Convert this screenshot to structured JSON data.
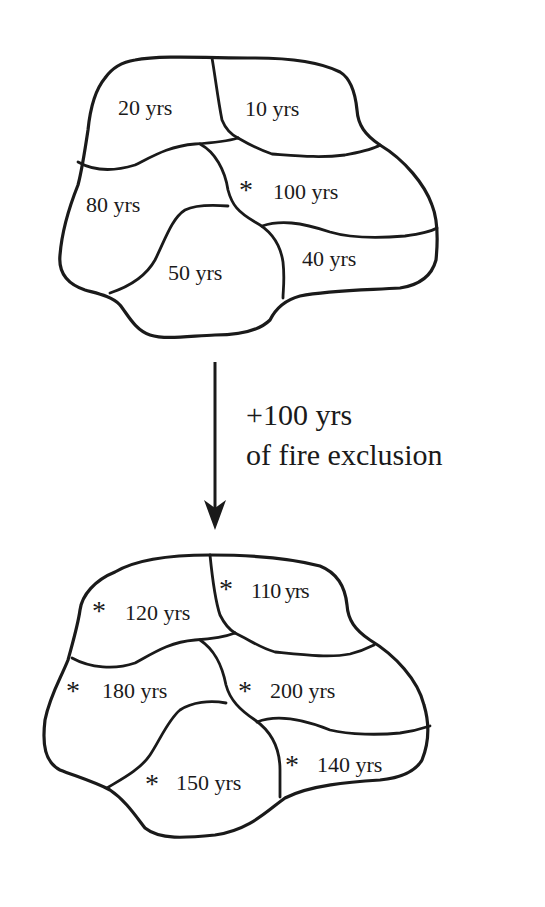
{
  "diagram": {
    "type": "landscape stand-age mosaic before/after fire exclusion",
    "marker_symbol": "*",
    "before": {
      "patches": [
        {
          "id": "nw",
          "label": "20 yrs",
          "marked": false
        },
        {
          "id": "ne",
          "label": "10 yrs",
          "marked": false
        },
        {
          "id": "w",
          "label": "80 yrs",
          "marked": false
        },
        {
          "id": "e",
          "label": "100 yrs",
          "marked": true
        },
        {
          "id": "s",
          "label": "50 yrs",
          "marked": false
        },
        {
          "id": "se",
          "label": "40 yrs",
          "marked": false
        }
      ]
    },
    "transition": {
      "line1": "+100 yrs",
      "line2": "of fire exclusion"
    },
    "after": {
      "patches": [
        {
          "id": "nw",
          "label": "120 yrs",
          "marked": true
        },
        {
          "id": "ne",
          "label": "110 yrs",
          "marked": true
        },
        {
          "id": "w",
          "label": "180 yrs",
          "marked": true
        },
        {
          "id": "e",
          "label": "200 yrs",
          "marked": true
        },
        {
          "id": "s",
          "label": "150 yrs",
          "marked": true
        },
        {
          "id": "se",
          "label": "140 yrs",
          "marked": true
        }
      ]
    }
  }
}
